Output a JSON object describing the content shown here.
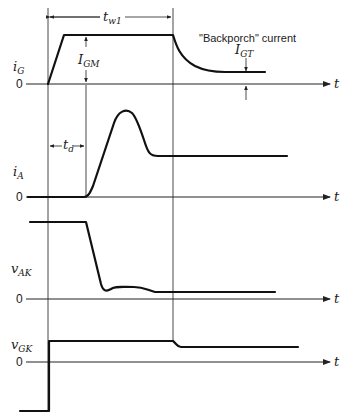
{
  "figure": {
    "time_axis_label": "t",
    "zero_label": "0",
    "annotations": {
      "pulse_width": {
        "main": "t",
        "sub": "w1"
      },
      "gate_max": {
        "main": "I",
        "sub": "GM"
      },
      "delay": {
        "main": "t",
        "sub": "d"
      },
      "backporch_note": "\"Backporch\" current",
      "gate_trigger": {
        "main": "I",
        "sub": "GT"
      }
    },
    "traces": [
      {
        "name": "i_G",
        "main": "i",
        "sub": "G"
      },
      {
        "name": "i_A",
        "main": "i",
        "sub": "A"
      },
      {
        "name": "v_AK",
        "main": "v",
        "sub": "AK"
      },
      {
        "name": "v_GK",
        "main": "v",
        "sub": "GK"
      }
    ]
  }
}
